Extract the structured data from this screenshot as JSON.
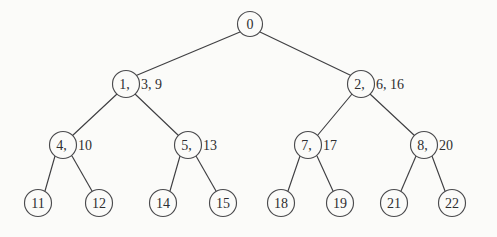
{
  "figure": {
    "background_color": "#fbfbf9",
    "stroke_color": "#3f3f42",
    "text_color": "#2e2e30"
  },
  "tree": {
    "nodes": [
      {
        "id": "n0",
        "label": "0",
        "annotation": "",
        "cx": 250,
        "cy": 24,
        "r": 12.5,
        "level": 0,
        "font_size": 14,
        "label_dx": 0,
        "ann_dx": 0
      },
      {
        "id": "n1",
        "label": "1,",
        "annotation": "3, 9",
        "cx": 126,
        "cy": 84,
        "r": 13.5,
        "level": 1,
        "font_size": 14,
        "label_dx": -1.5,
        "ann_dx": 15
      },
      {
        "id": "n2",
        "label": "2,",
        "annotation": "6, 16",
        "cx": 361,
        "cy": 84,
        "r": 13.5,
        "level": 1,
        "font_size": 14,
        "label_dx": -1.5,
        "ann_dx": 15
      },
      {
        "id": "n4",
        "label": "4,",
        "annotation": "10",
        "cx": 63,
        "cy": 145,
        "r": 13.5,
        "level": 2,
        "font_size": 14,
        "label_dx": -1.5,
        "ann_dx": 15
      },
      {
        "id": "n5",
        "label": "5,",
        "annotation": "13",
        "cx": 188,
        "cy": 145,
        "r": 13.5,
        "level": 2,
        "font_size": 14,
        "label_dx": -1.5,
        "ann_dx": 15
      },
      {
        "id": "n7",
        "label": "7,",
        "annotation": "17",
        "cx": 308,
        "cy": 145,
        "r": 13.5,
        "level": 2,
        "font_size": 14,
        "label_dx": -1.5,
        "ann_dx": 15
      },
      {
        "id": "n8",
        "label": "8,",
        "annotation": "20",
        "cx": 424,
        "cy": 145,
        "r": 13.5,
        "level": 2,
        "font_size": 14,
        "label_dx": -1.5,
        "ann_dx": 15
      },
      {
        "id": "n11",
        "label": "11",
        "annotation": "",
        "cx": 38,
        "cy": 203,
        "r": 13.5,
        "level": 3,
        "font_size": 14,
        "label_dx": 0,
        "ann_dx": 0
      },
      {
        "id": "n12",
        "label": "12",
        "annotation": "",
        "cx": 99,
        "cy": 203,
        "r": 13.5,
        "level": 3,
        "font_size": 14,
        "label_dx": 0,
        "ann_dx": 0
      },
      {
        "id": "n14",
        "label": "14",
        "annotation": "",
        "cx": 163,
        "cy": 203,
        "r": 13.5,
        "level": 3,
        "font_size": 14,
        "label_dx": 0,
        "ann_dx": 0
      },
      {
        "id": "n15",
        "label": "15",
        "annotation": "",
        "cx": 223,
        "cy": 203,
        "r": 13.5,
        "level": 3,
        "font_size": 14,
        "label_dx": 0,
        "ann_dx": 0
      },
      {
        "id": "n18",
        "label": "18",
        "annotation": "",
        "cx": 281,
        "cy": 203,
        "r": 13.5,
        "level": 3,
        "font_size": 14,
        "label_dx": 0,
        "ann_dx": 0
      },
      {
        "id": "n19",
        "label": "19",
        "annotation": "",
        "cx": 340,
        "cy": 203,
        "r": 13.5,
        "level": 3,
        "font_size": 14,
        "label_dx": 0,
        "ann_dx": 0
      },
      {
        "id": "n21",
        "label": "21",
        "annotation": "",
        "cx": 394,
        "cy": 203,
        "r": 13.5,
        "level": 3,
        "font_size": 14,
        "label_dx": 0,
        "ann_dx": 0
      },
      {
        "id": "n22",
        "label": "22",
        "annotation": "",
        "cx": 452,
        "cy": 203,
        "r": 13.5,
        "level": 3,
        "font_size": 14,
        "label_dx": 0,
        "ann_dx": 0
      }
    ],
    "edges": [
      {
        "id": "e0-1",
        "from": "n0",
        "to": "n1",
        "x1": 240,
        "y1": 32,
        "x2": 135,
        "y2": 76
      },
      {
        "id": "e0-2",
        "from": "n0",
        "to": "n2",
        "x1": 260,
        "y1": 32,
        "x2": 352,
        "y2": 76
      },
      {
        "id": "e1-4",
        "from": "n1",
        "to": "n4",
        "x1": 117,
        "y1": 94,
        "x2": 72,
        "y2": 136
      },
      {
        "id": "e1-5",
        "from": "n1",
        "to": "n5",
        "x1": 135,
        "y1": 94,
        "x2": 179,
        "y2": 136
      },
      {
        "id": "e2-7",
        "from": "n2",
        "to": "n7",
        "x1": 352,
        "y1": 94,
        "x2": 317,
        "y2": 136
      },
      {
        "id": "e2-8",
        "from": "n2",
        "to": "n8",
        "x1": 370,
        "y1": 94,
        "x2": 415,
        "y2": 136
      },
      {
        "id": "e4-11",
        "from": "n4",
        "to": "n11",
        "x1": 55,
        "y1": 156,
        "x2": 45,
        "y2": 191
      },
      {
        "id": "e4-12",
        "from": "n4",
        "to": "n12",
        "x1": 72,
        "y1": 156,
        "x2": 92,
        "y2": 191
      },
      {
        "id": "e5-14",
        "from": "n5",
        "to": "n14",
        "x1": 180,
        "y1": 156,
        "x2": 170,
        "y2": 191
      },
      {
        "id": "e5-15",
        "from": "n5",
        "to": "n15",
        "x1": 196,
        "y1": 156,
        "x2": 216,
        "y2": 191
      },
      {
        "id": "e7-18",
        "from": "n7",
        "to": "n18",
        "x1": 300,
        "y1": 156,
        "x2": 288,
        "y2": 191
      },
      {
        "id": "e7-19",
        "from": "n7",
        "to": "n19",
        "x1": 317,
        "y1": 156,
        "x2": 333,
        "y2": 191
      },
      {
        "id": "e8-21",
        "from": "n8",
        "to": "n21",
        "x1": 416,
        "y1": 156,
        "x2": 401,
        "y2": 191
      },
      {
        "id": "e8-22",
        "from": "n8",
        "to": "n22",
        "x1": 432,
        "y1": 156,
        "x2": 445,
        "y2": 191
      }
    ]
  }
}
